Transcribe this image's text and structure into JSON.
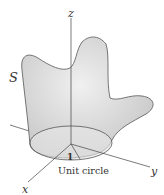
{
  "diagram": {
    "surface_label": "S",
    "axes": {
      "x": "x",
      "y": "y",
      "z": "z"
    },
    "radius_label": "1",
    "circle_label": "Unit circle",
    "colors": {
      "surface": "#d9d9d9",
      "stroke": "#555555",
      "axis": "#444444"
    }
  }
}
